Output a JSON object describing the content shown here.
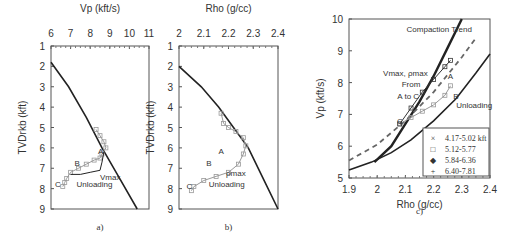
{
  "chart_data": [
    {
      "id": "a",
      "type": "line",
      "caption": "a)",
      "title": "",
      "xlabel": "Vp (kft/s)",
      "ylabel": "TVDrkb (kft)",
      "xlim": [
        6,
        11
      ],
      "ylim": [
        9,
        1
      ],
      "xticks": [
        "6",
        "7",
        "8",
        "9",
        "10",
        "11"
      ],
      "yticks": [
        "1",
        "2",
        "3",
        "4",
        "5",
        "6",
        "7",
        "8",
        "9"
      ],
      "x_axis_position": "top",
      "series": [
        {
          "name": "Compaction trend",
          "style": "solid-dark",
          "x": [
            6.0,
            6.9,
            7.8,
            8.6,
            9.5,
            10.4
          ],
          "y": [
            1.8,
            3.0,
            4.5,
            6.0,
            7.5,
            9.0
          ]
        },
        {
          "name": "Measured Vp",
          "style": "markers-gray",
          "x": [
            8.3,
            8.5,
            8.7,
            8.8,
            8.6,
            8.5,
            8.2,
            7.8,
            7.4,
            7.0,
            6.8,
            6.7,
            6.6
          ],
          "y": [
            5.1,
            5.4,
            5.7,
            6.0,
            6.3,
            6.5,
            6.6,
            6.8,
            7.0,
            7.2,
            7.5,
            7.7,
            7.9
          ]
        },
        {
          "name": "Unloading path",
          "style": "solid-dark-thin",
          "x": [
            8.7,
            8.6,
            8.5,
            8.0,
            7.5,
            7.0
          ],
          "y": [
            6.2,
            6.7,
            7.1,
            7.2,
            7.3,
            7.3
          ]
        }
      ],
      "annotations": [
        "A",
        "B",
        "C",
        "Vmax",
        "Unloading"
      ]
    },
    {
      "id": "b",
      "type": "line",
      "caption": "b)",
      "xlabel": "Rho (g/cc)",
      "ylabel": "TVDrkb (kft)",
      "xlim": [
        2.0,
        2.4
      ],
      "ylim": [
        9,
        1
      ],
      "xticks": [
        "2",
        "2.1",
        "2.2",
        "2.3",
        "2.4"
      ],
      "yticks": [
        "1",
        "2",
        "3",
        "4",
        "5",
        "6",
        "7",
        "8",
        "9"
      ],
      "x_axis_position": "top",
      "series": [
        {
          "name": "Compaction trend",
          "style": "solid-dark",
          "x": [
            2.0,
            2.09,
            2.16,
            2.22,
            2.28,
            2.34,
            2.4
          ],
          "y": [
            2.0,
            3.0,
            4.0,
            5.0,
            6.0,
            7.5,
            9.0
          ]
        },
        {
          "name": "Measured Rho",
          "style": "markers-gray",
          "x": [
            2.17,
            2.18,
            2.2,
            2.23,
            2.26,
            2.27,
            2.26,
            2.24,
            2.2,
            2.15,
            2.1,
            2.06,
            2.05
          ],
          "y": [
            4.3,
            4.8,
            5.0,
            5.2,
            5.5,
            5.9,
            6.3,
            6.8,
            7.2,
            7.4,
            7.6,
            7.9,
            8.1
          ]
        }
      ],
      "annotations": [
        "A",
        "B",
        "C",
        "ρmax",
        "Unloading"
      ]
    },
    {
      "id": "c",
      "type": "scatter",
      "caption": "c)",
      "xlabel": "Rho (g/cc)",
      "ylabel": "Vp (kft/s)",
      "xlim": [
        1.9,
        2.4
      ],
      "ylim": [
        5,
        10
      ],
      "xticks": [
        "1.9",
        "2",
        "2.1",
        "2.2",
        "2.3",
        "2.4"
      ],
      "yticks": [
        "5",
        "6",
        "7",
        "8",
        "9",
        "10"
      ],
      "legend_position": "bottom-right",
      "legend": [
        {
          "symbol": "×",
          "label": "4.17-5.02 kft"
        },
        {
          "symbol": "□",
          "label": "5.12-5.77"
        },
        {
          "symbol": "◆",
          "label": "5.84-6.36"
        },
        {
          "symbol": "+",
          "label": "6.40-7.81"
        }
      ],
      "series": [
        {
          "name": "Compaction Trend",
          "style": "solid-thick",
          "x": [
            1.99,
            2.05,
            2.1,
            2.15,
            2.2,
            2.25,
            2.3
          ],
          "y": [
            5.5,
            6.0,
            6.7,
            7.4,
            8.2,
            9.1,
            10.0
          ]
        },
        {
          "name": "Unloading lower",
          "style": "solid",
          "x": [
            1.9,
            1.98,
            2.05,
            2.12,
            2.2,
            2.28,
            2.35,
            2.4
          ],
          "y": [
            5.25,
            5.5,
            5.8,
            6.2,
            6.8,
            7.5,
            8.3,
            8.9
          ]
        },
        {
          "name": "Dashed trend",
          "style": "dashed",
          "x": [
            1.9,
            2.0,
            2.1,
            2.2,
            2.3,
            2.35
          ],
          "y": [
            5.55,
            6.05,
            6.8,
            7.7,
            8.8,
            9.4
          ]
        },
        {
          "name": "Unloading data",
          "style": "markers-gray",
          "x": [
            2.08,
            2.12,
            2.16,
            2.2,
            2.24,
            2.26
          ],
          "y": [
            6.7,
            6.9,
            7.1,
            7.3,
            7.6,
            7.9
          ]
        },
        {
          "name": "Loading data",
          "style": "markers-dark",
          "x": [
            2.08,
            2.12,
            2.16,
            2.2,
            2.24,
            2.26
          ],
          "y": [
            6.7,
            7.2,
            7.7,
            8.1,
            8.5,
            8.7
          ]
        }
      ],
      "annotations": [
        "Compaction Trend",
        "Vmax, ρmax",
        "From",
        "A to C",
        "A",
        "B",
        "C",
        "Unloading"
      ]
    }
  ]
}
